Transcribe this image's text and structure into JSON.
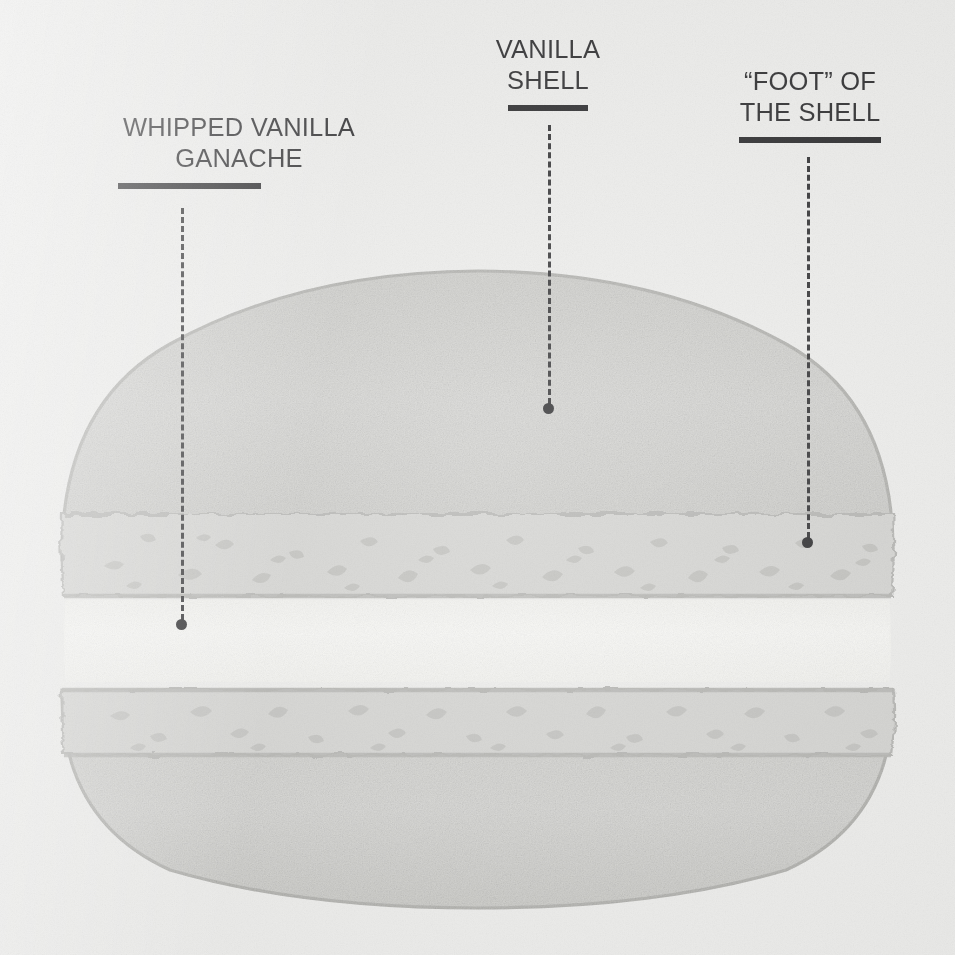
{
  "canvas": {
    "width": 955,
    "height": 955,
    "background_color": "#ebebe9",
    "ink_color": "#18181a"
  },
  "diagram": {
    "labels": [
      {
        "id": "whipped-vanilla-ganache",
        "text": "WHIPPED VANILLA\nGANACHE",
        "rule_width": 143,
        "leader": {
          "x": 181,
          "y_start": 208,
          "y_end": 620,
          "dot_x": 181,
          "dot_y": 625
        }
      },
      {
        "id": "vanilla-shell",
        "text": "VANILLA\nSHELL",
        "rule_width": 80,
        "leader": {
          "x": 548,
          "y_start": 125,
          "y_end": 404,
          "dot_x": 548,
          "dot_y": 409
        }
      },
      {
        "id": "foot-of-the-shell",
        "text": "“FOOT” OF\nTHE SHELL",
        "rule_width": 142,
        "leader": {
          "x": 807,
          "y_start": 157,
          "y_end": 538,
          "dot_x": 807,
          "dot_y": 543
        }
      }
    ],
    "parts": [
      {
        "id": "top-shell-dome",
        "name": "top shell dome",
        "fill_color": "#d2d2cf",
        "outline_color": "#b4b4b0"
      },
      {
        "id": "top-shell-foot",
        "name": "top shell foot",
        "fill_color": "#cfcfcc",
        "outline_color": "#adadaa",
        "speckled": true
      },
      {
        "id": "ganache-layer",
        "name": "whipped vanilla ganache",
        "fill_color": "#f7f7f3",
        "outline_color": "#f2f2ee"
      },
      {
        "id": "bottom-shell-foot",
        "name": "bottom shell foot",
        "fill_color": "#cfcfcc",
        "outline_color": "#adadaa",
        "speckled": true
      },
      {
        "id": "bottom-shell-dome",
        "name": "bottom shell dome",
        "fill_color": "#d2d2cf",
        "outline_color": "#b4b4b0"
      }
    ]
  }
}
